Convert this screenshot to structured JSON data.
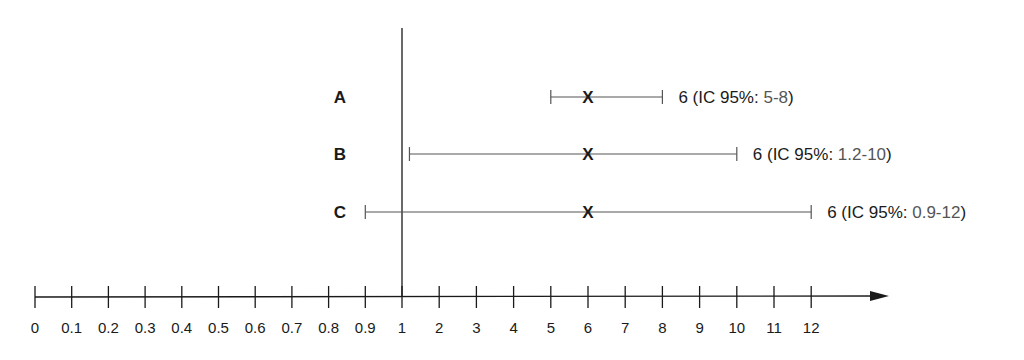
{
  "chart_data": {
    "type": "forest",
    "title": "",
    "xlabel": "",
    "ylabel": "",
    "x_axis": {
      "scale": "piecewise (0-1 step 0.1, 1-12 step 1)",
      "ticks": [
        0,
        0.1,
        0.2,
        0.3,
        0.4,
        0.5,
        0.6,
        0.7,
        0.8,
        0.9,
        1,
        2,
        3,
        4,
        5,
        6,
        7,
        8,
        9,
        10,
        11,
        12
      ],
      "tick_labels": [
        "0",
        "0.1",
        "0.2",
        "0.3",
        "0.4",
        "0.5",
        "0.6",
        "0.7",
        "0.8",
        "0.9",
        "1",
        "2",
        "3",
        "4",
        "5",
        "6",
        "7",
        "8",
        "9",
        "10",
        "11",
        "12"
      ],
      "arrow": true
    },
    "reference_line": 1,
    "grid": false,
    "marker": "X",
    "series": [
      {
        "name": "A",
        "estimate": 6,
        "ci_low": 5,
        "ci_high": 8,
        "label_prefix": "6 (IC 95%: ",
        "label_range": "5-8",
        "label_suffix": ")"
      },
      {
        "name": "B",
        "estimate": 6,
        "ci_low": 1.2,
        "ci_high": 10,
        "label_prefix": "6 (IC 95%: ",
        "label_range": "1.2-10",
        "label_suffix": ")"
      },
      {
        "name": "C",
        "estimate": 6,
        "ci_low": 0.9,
        "ci_high": 12,
        "label_prefix": "6 (IC 95%: ",
        "label_range": "0.9-12",
        "label_suffix": ")"
      }
    ],
    "colors": {
      "axis": "#1a1a1a",
      "ci_line": "#555555",
      "text": "#1a1a1a",
      "range_text": "#555555"
    }
  }
}
